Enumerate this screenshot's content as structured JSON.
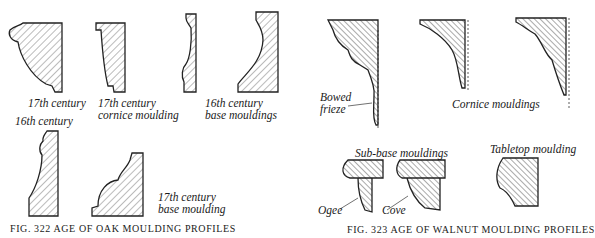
{
  "figure_322": {
    "caption": "FIG. 322  AGE OF OAK MOULDING PROFILES",
    "labels": {
      "a": "17th century",
      "b1": "17th century",
      "b2": "cornice moulding",
      "c1": "16th century",
      "c2": "base mouldings",
      "d": "16th century",
      "e1": "17th century",
      "e2": "base moulding"
    }
  },
  "figure_323": {
    "caption": "FIG. 323  AGE OF WALNUT MOULDING PROFILES",
    "labels": {
      "bowed1": "Bowed",
      "bowed2": "frieze",
      "cornice": "Cornice mouldings",
      "subbase": "Sub-base mouldings",
      "tabletop": "Tabletop moulding",
      "ogee": "Ogee",
      "cove": "Cove"
    }
  }
}
